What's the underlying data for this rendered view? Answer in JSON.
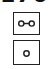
{
  "header": {
    "partial_text": "170"
  },
  "symbols": [
    {
      "icon": "two-circles-connected-icon",
      "color": "#222222"
    },
    {
      "icon": "single-circle-icon",
      "color": "#222222"
    }
  ]
}
